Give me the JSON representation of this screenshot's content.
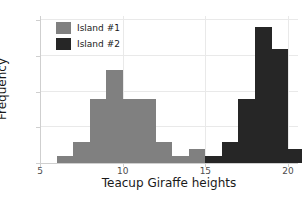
{
  "chart_data": {
    "type": "bar",
    "title": "",
    "xlabel": "Teacup Giraffe heights",
    "ylabel": "Frequency",
    "xlim": [
      5,
      20.6
    ],
    "ylim": [
      0,
      20.6
    ],
    "xticks": [
      5,
      10,
      15,
      20
    ],
    "yticks": [
      0,
      5,
      10,
      15,
      20
    ],
    "grid": true,
    "legend_position": "upper left",
    "bin_width": 1,
    "series": [
      {
        "name": "Island #1",
        "color": "#808080",
        "bins": [
          6,
          7,
          8,
          9,
          10,
          11,
          12,
          13,
          14
        ],
        "values": [
          1,
          3,
          9,
          13,
          9,
          9,
          3,
          1,
          2
        ]
      },
      {
        "name": "Island #2",
        "color": "#262626",
        "bins": [
          15,
          16,
          17,
          18,
          19,
          20
        ],
        "values": [
          1,
          3,
          9,
          19,
          16,
          2
        ]
      }
    ]
  },
  "legend": {
    "entries": [
      {
        "label": "Island #1",
        "color": "#808080"
      },
      {
        "label": "Island #2",
        "color": "#262626"
      }
    ]
  },
  "axes": {
    "x_tick_labels": [
      "5",
      "10",
      "15",
      "20"
    ],
    "y_tick_labels": [
      "0",
      "5",
      "10",
      "15",
      "20"
    ],
    "x_title": "Teacup Giraffe heights",
    "y_title": "Frequency"
  }
}
